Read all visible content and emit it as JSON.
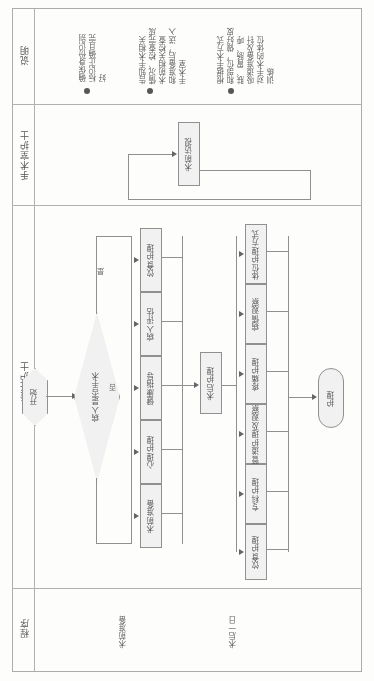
{
  "document": {
    "type": "swimlane-flowchart-scan",
    "orientation": "rotated-90",
    "page_background": "#fdfdfc",
    "line_color": "#8d8d8d"
  },
  "bands": [
    {
      "id": "description",
      "label": "说明"
    },
    {
      "id": "or_nurse",
      "label": "手术室护士"
    },
    {
      "id": "primary_nurse",
      "label": "责任护士"
    },
    {
      "id": "procedure",
      "label": "程序"
    }
  ],
  "description_notes": [
    {
      "bullet": "●",
      "text": "确保身份识别\n标识正确且完\n好"
    },
    {
      "bullet": "●",
      "text": "告知手术相关\n情况、检查完成\n术前相关检查\n和准备后，送入\n手术室"
    },
    {
      "bullet": "●",
      "text": "根据手术方式\n和部位，做好皮\n肤、胃肠、呼\n吸道准备及针\n对手术的体位\n训练"
    }
  ],
  "or_nurse_nodes": [
    {
      "id": "preop-visit",
      "label": "术前访视",
      "shape": "rect"
    }
  ],
  "primary_nurse_nodes": [
    {
      "id": "start",
      "label": "开始",
      "shape": "hexagon"
    },
    {
      "id": "decision",
      "label": "病人是否手术",
      "shape": "diamond"
    },
    {
      "id": "postop-care",
      "label": "术后护理",
      "shape": "rect"
    },
    {
      "id": "end",
      "label": "护理",
      "shape": "terminator"
    }
  ],
  "preop_column": [
    {
      "id": "preop-1",
      "label": "饮食护理",
      "shape": "rect"
    },
    {
      "id": "preop-2",
      "label": "病人评估",
      "shape": "rect"
    },
    {
      "id": "preop-3",
      "label": "健康指导",
      "shape": "rect"
    },
    {
      "id": "preop-4",
      "label": "心理护理",
      "shape": "rect"
    },
    {
      "id": "preop-5",
      "label": "术前准备",
      "shape": "rect"
    }
  ],
  "postop_column": [
    {
      "id": "post-1",
      "label": "体位护理方式",
      "shape": "rect"
    },
    {
      "id": "post-2",
      "label": "病情观察",
      "shape": "rect"
    },
    {
      "id": "post-3",
      "label": "疼痛护理",
      "shape": "rect"
    },
    {
      "id": "post-4",
      "label": "管道护理及观察",
      "shape": "rect"
    },
    {
      "id": "post-5",
      "label": "专科护理",
      "shape": "rect"
    },
    {
      "id": "post-6",
      "label": "饮食护理",
      "shape": "rect"
    }
  ],
  "edge_labels": [
    {
      "id": "edge-yes",
      "label": "是"
    },
    {
      "id": "edge-no",
      "label": "否"
    }
  ],
  "procedure_labels": [
    {
      "id": "proc-1",
      "label": "术前准备"
    },
    {
      "id": "proc-2",
      "label": "术后一日"
    }
  ]
}
